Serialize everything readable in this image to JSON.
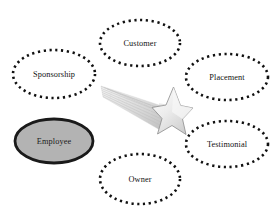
{
  "diagram": {
    "background_color": "#ffffff",
    "nodes": [
      {
        "id": "customer",
        "label": "Customer",
        "style": "dotted-ellipse",
        "fill_color": "#ffffff",
        "stroke_color": "#111111",
        "cx": 140,
        "cy": 43,
        "rx": 40,
        "ry": 23
      },
      {
        "id": "sponsorship",
        "label": "Sponsorship",
        "style": "dotted-ellipse",
        "fill_color": "#ffffff",
        "stroke_color": "#111111",
        "cx": 54,
        "cy": 74,
        "rx": 41,
        "ry": 24
      },
      {
        "id": "placement",
        "label": "Placement",
        "style": "dotted-ellipse",
        "fill_color": "#ffffff",
        "stroke_color": "#111111",
        "cx": 227,
        "cy": 77,
        "rx": 41,
        "ry": 23
      },
      {
        "id": "testimonial",
        "label": "Testimonial",
        "style": "dotted-ellipse",
        "fill_color": "#ffffff",
        "stroke_color": "#111111",
        "cx": 227,
        "cy": 144,
        "rx": 41,
        "ry": 23
      },
      {
        "id": "employee",
        "label": "Employee",
        "style": "solid-ellipse-shaded",
        "fill_color": "#b3b3b3",
        "stroke_color": "#1a1a1a",
        "cx": 54,
        "cy": 141,
        "rx": 39,
        "ry": 22
      },
      {
        "id": "owner",
        "label": "Owner",
        "style": "dotted-ellipse",
        "fill_color": "#ffffff",
        "stroke_color": "#111111",
        "cx": 140,
        "cy": 179,
        "rx": 40,
        "ry": 25
      }
    ],
    "decoration": {
      "id": "shooting-star",
      "name": "shooting-star-graphic",
      "star_fill": "#f2f2f2",
      "star_stroke": "#8f8f8f",
      "trail_color": "#cfcfcf",
      "center_x": 166,
      "center_y": 113
    }
  }
}
